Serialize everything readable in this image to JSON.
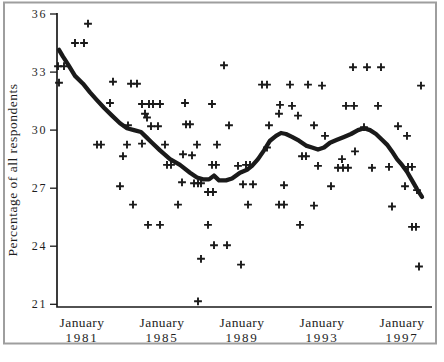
{
  "colors": {
    "ink": "#1a1a1a",
    "frame": "#9e9e9e",
    "background": "#ffffff"
  },
  "chart_data": {
    "type": "scatter",
    "title": "",
    "xlabel": "",
    "ylabel": "Percentage of all respondents",
    "grid": false,
    "legend": "none",
    "ylim": [
      21,
      36
    ],
    "xlim_years": [
      1979.75,
      1998.5
    ],
    "y_ticks": [
      36,
      33,
      30,
      27,
      24,
      21
    ],
    "x_ticks": [
      {
        "month": "January",
        "year": "1981"
      },
      {
        "month": "January",
        "year": "1985"
      },
      {
        "month": "January",
        "year": "1989"
      },
      {
        "month": "January",
        "year": "1993"
      },
      {
        "month": "January",
        "year": "1997"
      }
    ],
    "series": [
      {
        "name": "survey responses",
        "type": "scatter",
        "marker": "plus",
        "points": [
          [
            1981.3,
            35.5
          ],
          [
            1980.65,
            34.5
          ],
          [
            1981.1,
            34.5
          ],
          [
            1979.8,
            33.3
          ],
          [
            1980.1,
            33.3
          ],
          [
            1979.85,
            32.45
          ],
          [
            1982.55,
            32.5
          ],
          [
            1983.45,
            32.4
          ],
          [
            1983.75,
            32.4
          ],
          [
            1988.1,
            33.35
          ],
          [
            1990.0,
            32.35
          ],
          [
            1990.25,
            32.35
          ],
          [
            1991.4,
            32.35
          ],
          [
            1992.3,
            32.35
          ],
          [
            1993.0,
            32.3
          ],
          [
            1997.95,
            32.3
          ],
          [
            1994.55,
            33.25
          ],
          [
            1995.25,
            33.25
          ],
          [
            1995.95,
            33.25
          ],
          [
            1982.4,
            31.4
          ],
          [
            1984.0,
            31.35
          ],
          [
            1984.35,
            31.35
          ],
          [
            1984.55,
            31.35
          ],
          [
            1984.9,
            31.35
          ],
          [
            1986.15,
            31.4
          ],
          [
            1987.5,
            31.35
          ],
          [
            1990.9,
            31.3
          ],
          [
            1991.5,
            31.25
          ],
          [
            1994.2,
            31.25
          ],
          [
            1994.6,
            31.25
          ],
          [
            1995.8,
            31.25
          ],
          [
            1984.15,
            30.85
          ],
          [
            1984.25,
            30.65
          ],
          [
            1990.85,
            30.85
          ],
          [
            1991.8,
            30.75
          ],
          [
            1983.3,
            30.25
          ],
          [
            1984.45,
            30.2
          ],
          [
            1984.8,
            30.2
          ],
          [
            1986.2,
            30.3
          ],
          [
            1986.4,
            30.3
          ],
          [
            1988.35,
            30.25
          ],
          [
            1990.35,
            30.25
          ],
          [
            1992.6,
            30.25
          ],
          [
            1995.1,
            30.15
          ],
          [
            1996.8,
            30.2
          ],
          [
            1993.15,
            29.7
          ],
          [
            1997.25,
            29.7
          ],
          [
            1981.75,
            29.25
          ],
          [
            1981.95,
            29.25
          ],
          [
            1983.25,
            29.25
          ],
          [
            1984.0,
            29.3
          ],
          [
            1985.15,
            29.25
          ],
          [
            1986.75,
            29.25
          ],
          [
            1987.75,
            29.25
          ],
          [
            1990.25,
            29.1
          ],
          [
            1992.0,
            28.65
          ],
          [
            1992.2,
            28.65
          ],
          [
            1983.05,
            28.65
          ],
          [
            1986.05,
            28.75
          ],
          [
            1986.5,
            28.7
          ],
          [
            1994.0,
            28.5
          ],
          [
            1994.65,
            28.9
          ],
          [
            1985.25,
            28.2
          ],
          [
            1985.45,
            28.2
          ],
          [
            1987.5,
            28.2
          ],
          [
            1987.7,
            28.2
          ],
          [
            1988.8,
            28.15
          ],
          [
            1989.2,
            28.2
          ],
          [
            1989.4,
            28.2
          ],
          [
            1992.8,
            28.15
          ],
          [
            1993.8,
            28.05
          ],
          [
            1994.05,
            28.05
          ],
          [
            1994.3,
            28.05
          ],
          [
            1995.5,
            28.05
          ],
          [
            1996.35,
            28.1
          ],
          [
            1997.3,
            28.1
          ],
          [
            1997.5,
            28.1
          ],
          [
            1982.9,
            27.1
          ],
          [
            1986.0,
            27.3
          ],
          [
            1986.6,
            27.25
          ],
          [
            1986.8,
            27.25
          ],
          [
            1986.95,
            27.25
          ],
          [
            1989.05,
            27.2
          ],
          [
            1989.55,
            27.2
          ],
          [
            1991.1,
            27.15
          ],
          [
            1993.45,
            27.1
          ],
          [
            1997.15,
            27.1
          ],
          [
            1997.75,
            26.9
          ],
          [
            1987.3,
            26.8
          ],
          [
            1987.55,
            26.8
          ],
          [
            1983.55,
            26.15
          ],
          [
            1985.8,
            26.15
          ],
          [
            1989.3,
            26.15
          ],
          [
            1990.85,
            26.15
          ],
          [
            1991.1,
            26.15
          ],
          [
            1992.6,
            26.1
          ],
          [
            1996.5,
            26.05
          ],
          [
            1984.3,
            25.1
          ],
          [
            1984.9,
            25.1
          ],
          [
            1987.3,
            25.1
          ],
          [
            1991.9,
            25.1
          ],
          [
            1997.5,
            25.0
          ],
          [
            1997.7,
            25.0
          ],
          [
            1987.6,
            24.05
          ],
          [
            1988.25,
            24.05
          ],
          [
            1986.95,
            23.35
          ],
          [
            1988.95,
            23.05
          ],
          [
            1997.85,
            22.95
          ],
          [
            1986.8,
            21.15
          ]
        ]
      },
      {
        "name": "smoothed trend",
        "type": "line",
        "points": [
          [
            1979.85,
            34.15
          ],
          [
            1980.05,
            33.8
          ],
          [
            1980.3,
            33.4
          ],
          [
            1980.65,
            32.8
          ],
          [
            1981.05,
            32.4
          ],
          [
            1981.4,
            31.95
          ],
          [
            1981.7,
            31.6
          ],
          [
            1982.1,
            31.15
          ],
          [
            1982.5,
            30.75
          ],
          [
            1982.9,
            30.35
          ],
          [
            1983.25,
            30.1
          ],
          [
            1983.6,
            30.0
          ],
          [
            1983.95,
            29.9
          ],
          [
            1984.2,
            29.65
          ],
          [
            1984.5,
            29.35
          ],
          [
            1984.9,
            28.95
          ],
          [
            1985.4,
            28.5
          ],
          [
            1985.9,
            28.2
          ],
          [
            1986.4,
            27.8
          ],
          [
            1986.75,
            27.55
          ],
          [
            1987.05,
            27.45
          ],
          [
            1987.35,
            27.45
          ],
          [
            1987.6,
            27.65
          ],
          [
            1987.85,
            27.4
          ],
          [
            1988.2,
            27.4
          ],
          [
            1988.5,
            27.5
          ],
          [
            1988.9,
            27.8
          ],
          [
            1989.25,
            27.95
          ],
          [
            1989.5,
            28.15
          ],
          [
            1989.8,
            28.5
          ],
          [
            1990.1,
            28.95
          ],
          [
            1990.4,
            29.45
          ],
          [
            1990.7,
            29.7
          ],
          [
            1990.95,
            29.85
          ],
          [
            1991.2,
            29.8
          ],
          [
            1991.5,
            29.65
          ],
          [
            1991.85,
            29.45
          ],
          [
            1992.2,
            29.2
          ],
          [
            1992.5,
            29.1
          ],
          [
            1992.8,
            29.0
          ],
          [
            1993.1,
            29.1
          ],
          [
            1993.4,
            29.35
          ],
          [
            1993.75,
            29.5
          ],
          [
            1994.1,
            29.65
          ],
          [
            1994.45,
            29.8
          ],
          [
            1994.8,
            30.0
          ],
          [
            1995.1,
            30.1
          ],
          [
            1995.4,
            30.0
          ],
          [
            1995.7,
            29.8
          ],
          [
            1996.0,
            29.5
          ],
          [
            1996.25,
            29.25
          ],
          [
            1996.5,
            28.9
          ],
          [
            1996.75,
            28.5
          ],
          [
            1997.0,
            28.2
          ],
          [
            1997.25,
            27.85
          ],
          [
            1997.5,
            27.4
          ],
          [
            1997.75,
            26.95
          ],
          [
            1998.0,
            26.55
          ]
        ]
      }
    ]
  }
}
